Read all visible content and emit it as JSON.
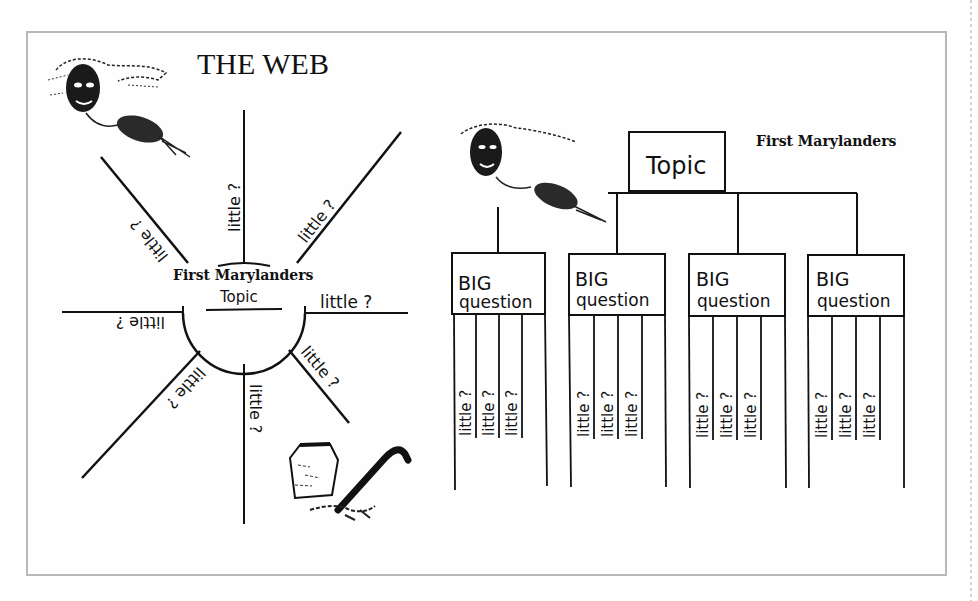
{
  "web_diagram": {
    "title": "THE WEB",
    "center_label": "First Marylanders",
    "center_sublabel": "Topic",
    "spokes": [
      {
        "label": "little ?",
        "angle": "up-left"
      },
      {
        "label": "little ?",
        "angle": "up"
      },
      {
        "label": "little ?",
        "angle": "up-right"
      },
      {
        "label": "little ?",
        "angle": "right"
      },
      {
        "label": "little ?",
        "angle": "down-right"
      },
      {
        "label": "little ?",
        "angle": "down"
      },
      {
        "label": "little ?",
        "angle": "down-left"
      },
      {
        "label": "little ?",
        "angle": "left"
      }
    ],
    "illustrations": [
      "native-figure-icon",
      "pottery-tool-icon"
    ]
  },
  "tree_diagram": {
    "header_label": "First Marylanders",
    "root_label": "Topic",
    "branches": [
      {
        "big_line1": "BIG",
        "big_line2": "question",
        "littles": [
          "little ?",
          "little ?",
          "little ?"
        ]
      },
      {
        "big_line1": "BIG",
        "big_line2": "question",
        "littles": [
          "little ?",
          "little ?",
          "little ?"
        ]
      },
      {
        "big_line1": "BIG",
        "big_line2": "question",
        "littles": [
          "little ?",
          "little ?",
          "little ?"
        ]
      },
      {
        "big_line1": "BIG",
        "big_line2": "question",
        "littles": [
          "little ?",
          "little ?",
          "little ?"
        ]
      }
    ],
    "illustrations": [
      "native-figure-icon"
    ]
  },
  "colors": {
    "ink": "#111111",
    "frame": "#b8b8b8",
    "background": "#ffffff"
  }
}
